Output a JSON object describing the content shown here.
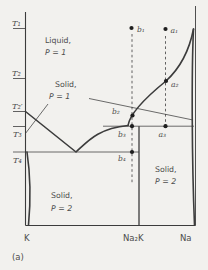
{
  "colors": {
    "background": "#f2f1ee",
    "line": "#3c3c3c",
    "text": "#4d4d4d",
    "dot": "#1e1e1e"
  },
  "temperature_labels": {
    "t1": "T₁",
    "t2": "T₂",
    "t2_prime": "T₂′",
    "t3": "T₃",
    "t4": "T₄"
  },
  "regions": {
    "liquid": {
      "line1": "Liquid,",
      "line2": "P = 1"
    },
    "solid_p1": {
      "line1": "Solid,",
      "line2": "P = 1"
    },
    "solid_p2_left": {
      "line1": "Solid,",
      "line2": "P = 2"
    },
    "solid_p2_right": {
      "line1": "Solid,",
      "line2": "P = 2"
    }
  },
  "points": {
    "b1": "b₁",
    "a1": "a₁",
    "a2": "a₂",
    "b2": "b₂",
    "b3": "b₃",
    "a3": "a₃",
    "b4": "b₄"
  },
  "x_axis_labels": {
    "left": "K",
    "compound": "Na₂K",
    "right": "Na"
  },
  "caption": "(a)",
  "diagram_data": {
    "type": "temperature-composition phase diagram",
    "x_axis_endpoints": [
      "K",
      "Na"
    ],
    "compound_line": "Na₂K",
    "y_axis_ticks": [
      "T₁",
      "T₂",
      "T₂′",
      "T₃",
      "T₄"
    ],
    "phase_regions": [
      "Liquid, P = 1",
      "Solid, P = 1",
      "Solid, P = 2",
      "Solid, P = 2"
    ],
    "isopleths": [
      {
        "name": "a",
        "points": [
          "a₁",
          "a₂",
          "a₃"
        ]
      },
      {
        "name": "b",
        "points": [
          "b₁",
          "b₂",
          "b₃",
          "b₄"
        ]
      }
    ],
    "features": {
      "horizontal_line_T4": "eutectic line from K axis to Na₂K line (through b₄)",
      "horizontal_line_T3": "peritectic line through b₃ and a₃ to Na side",
      "liquidus": "descends from T₂′ on K axis to eutectic minimum, rises through b₂ and a₂ to Na axis near T₁"
    }
  }
}
